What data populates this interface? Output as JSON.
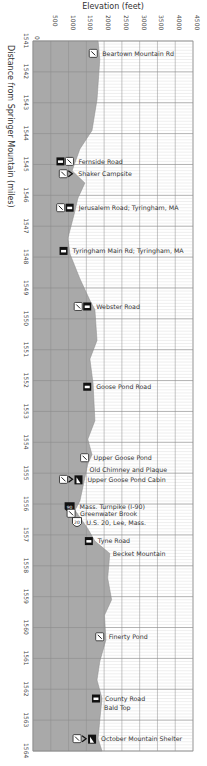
{
  "chart_data": {
    "type": "area",
    "title": "",
    "xlabel": "Elevation (feet)",
    "ylabel": "Distance from Springer Mountain (miles)",
    "orientation": "vertical-profile",
    "elevation_ticks": [
      0,
      500,
      1000,
      1500,
      2000,
      2500,
      3000,
      3500,
      4000,
      4500
    ],
    "elevation_range": [
      0,
      4500
    ],
    "mile_ticks": [
      1541,
      1542,
      1543,
      1544,
      1545,
      1546,
      1547,
      1548,
      1549,
      1550,
      1551,
      1552,
      1553,
      1554,
      1555,
      1556,
      1557,
      1558,
      1559,
      1560,
      1561,
      1562,
      1563,
      1564
    ],
    "mile_range": [
      1541,
      1564
    ],
    "grid": true,
    "profile": [
      {
        "mile": 1541.0,
        "elev": 1830
      },
      {
        "mile": 1541.6,
        "elev": 1880
      },
      {
        "mile": 1542.9,
        "elev": 1800
      },
      {
        "mile": 1543.9,
        "elev": 1660
      },
      {
        "mile": 1544.5,
        "elev": 1320
      },
      {
        "mile": 1545.2,
        "elev": 1100
      },
      {
        "mile": 1545.6,
        "elev": 1460
      },
      {
        "mile": 1546.1,
        "elev": 1260
      },
      {
        "mile": 1546.5,
        "elev": 1180
      },
      {
        "mile": 1547.4,
        "elev": 980
      },
      {
        "mile": 1547.9,
        "elev": 1040
      },
      {
        "mile": 1548.7,
        "elev": 1320
      },
      {
        "mile": 1549.4,
        "elev": 1600
      },
      {
        "mile": 1549.7,
        "elev": 1740
      },
      {
        "mile": 1550.7,
        "elev": 1800
      },
      {
        "mile": 1551.3,
        "elev": 1600
      },
      {
        "mile": 1552.1,
        "elev": 1690
      },
      {
        "mile": 1553.3,
        "elev": 1740
      },
      {
        "mile": 1553.9,
        "elev": 1540
      },
      {
        "mile": 1554.4,
        "elev": 1660
      },
      {
        "mile": 1554.7,
        "elev": 1540
      },
      {
        "mile": 1555.9,
        "elev": 1320
      },
      {
        "mile": 1556.2,
        "elev": 1180
      },
      {
        "mile": 1556.8,
        "elev": 1540
      },
      {
        "mile": 1557.2,
        "elev": 1740
      },
      {
        "mile": 1557.6,
        "elev": 2160
      },
      {
        "mile": 1558.4,
        "elev": 2100
      },
      {
        "mile": 1559.1,
        "elev": 2210
      },
      {
        "mile": 1559.6,
        "elev": 2010
      },
      {
        "mile": 1560.4,
        "elev": 2050
      },
      {
        "mile": 1561.1,
        "elev": 1880
      },
      {
        "mile": 1561.7,
        "elev": 1800
      },
      {
        "mile": 1562.3,
        "elev": 1940
      },
      {
        "mile": 1563.0,
        "elev": 1880
      },
      {
        "mile": 1563.6,
        "elev": 1830
      },
      {
        "mile": 1564.0,
        "elev": 1940
      }
    ],
    "landmarks": [
      {
        "mile": 1541.4,
        "name": "Beartown Mountain Rd",
        "icons": [
          "water"
        ]
      },
      {
        "mile": 1544.9,
        "name": "Fernside Road",
        "icons": [
          "parking",
          "water"
        ]
      },
      {
        "mile": 1545.3,
        "name": "Shaker Campsite",
        "icons": [
          "water",
          "campsite"
        ]
      },
      {
        "mile": 1546.4,
        "name": "Jerusalem Road; Tyringham, MA",
        "icons": [
          "water",
          "parking"
        ]
      },
      {
        "mile": 1547.8,
        "name": "Tyringham Main Rd; Tyringham, MA",
        "icons": [
          "parking"
        ]
      },
      {
        "mile": 1549.6,
        "name": "Webster Road",
        "icons": [
          "water",
          "parking"
        ]
      },
      {
        "mile": 1552.2,
        "name": "Goose Pond Road",
        "icons": [
          "parking"
        ]
      },
      {
        "mile": 1554.5,
        "name": "Upper Goose Pond",
        "icons": [
          "water"
        ]
      },
      {
        "mile": 1554.9,
        "name": "Old Chimney and Plaque",
        "icons": []
      },
      {
        "mile": 1555.2,
        "name": "Upper Goose Pond Cabin",
        "icons": [
          "water",
          "campsite",
          "shelter"
        ]
      },
      {
        "mile": 1556.1,
        "name": "Mass. Turnpike (I-90)",
        "icons": [
          "interstate-90"
        ]
      },
      {
        "mile": 1556.3,
        "name": "Greenwater Brook",
        "icons": [
          "water"
        ]
      },
      {
        "mile": 1556.6,
        "name": "U.S. 20, Lee, Mass.",
        "icons": [
          "us-route-20"
        ]
      },
      {
        "mile": 1557.2,
        "name": "Tyne Road",
        "icons": [
          "parking"
        ]
      },
      {
        "mile": 1557.6,
        "name": "Becket Mountain",
        "icons": []
      },
      {
        "mile": 1560.3,
        "name": "Finerty Pond",
        "icons": [
          "water"
        ]
      },
      {
        "mile": 1562.3,
        "name": "County Road",
        "icons": [
          "parking"
        ]
      },
      {
        "mile": 1562.6,
        "name": "Bald Top",
        "icons": []
      },
      {
        "mile": 1563.6,
        "name": "October Mountain Shelter",
        "icons": [
          "water",
          "campsite",
          "shelter"
        ]
      }
    ],
    "colors": {
      "profile_fill": "#a9a9a9",
      "grid_major": "#8c8c8c",
      "grid_minor": "#d6d6d6",
      "background": "#ffffff"
    }
  }
}
